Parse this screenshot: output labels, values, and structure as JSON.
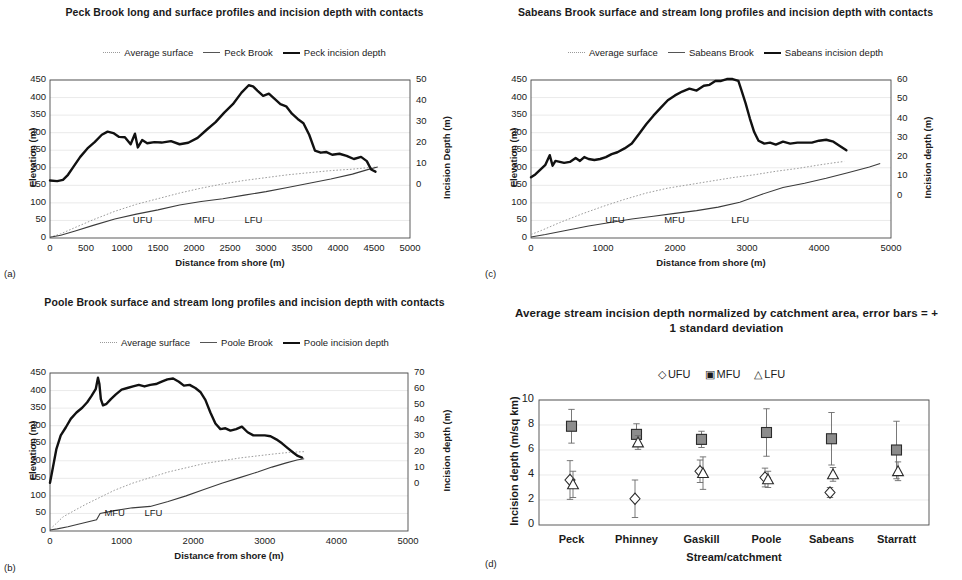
{
  "figure": {
    "panels": [
      {
        "tag": "(a)",
        "title": "Peck Brook long and surface profiles and incision depth with contacts",
        "legend": [
          {
            "label": "Average surface",
            "style": "dotted"
          },
          {
            "label": "Peck Brook",
            "style": "thin"
          },
          {
            "label": "Peck incision depth",
            "style": "thick"
          }
        ],
        "contacts": [
          {
            "label": "UFU",
            "x": 1150
          },
          {
            "label": "MFU",
            "x": 2000
          },
          {
            "label": "LFU",
            "x": 2700
          }
        ]
      },
      {
        "tag": "(b)",
        "title": "Poole Brook surface and stream long profiles and incision depth with contacts",
        "legend": [
          {
            "label": "Average surface",
            "style": "dotted"
          },
          {
            "label": "Poole Brook",
            "style": "thin"
          },
          {
            "label": "Poole incision depth",
            "style": "thick"
          }
        ],
        "contacts": [
          {
            "label": "MFU",
            "x": 760
          },
          {
            "label": "LFU",
            "x": 1320
          }
        ]
      },
      {
        "tag": "(c)",
        "title": "Sabeans Brook surface and stream long profiles and incision depth with contacts",
        "legend": [
          {
            "label": "Average surface",
            "style": "dotted"
          },
          {
            "label": "Sabeans Brook",
            "style": "thin"
          },
          {
            "label": "Sabeans incision depth",
            "style": "thick"
          }
        ],
        "contacts": [
          {
            "label": "UFU",
            "x": 1030
          },
          {
            "label": "MFU",
            "x": 1850
          },
          {
            "label": "LFU",
            "x": 2780
          }
        ]
      },
      {
        "tag": "(d)",
        "title": "Average stream incision depth normalized by catchment area, error bars = + 1 standard deviation",
        "legend": [
          {
            "label": "UFU",
            "glyph": "◇"
          },
          {
            "label": "MFU",
            "glyph": "▣"
          },
          {
            "label": "LFU",
            "glyph": "△"
          }
        ]
      }
    ]
  },
  "chart_data": [
    {
      "type": "line",
      "panel": "a",
      "title": "Peck Brook long and surface profiles and incision depth with contacts",
      "xlabel": "Distance from shore (m)",
      "ylabel": "Elevation (m)",
      "y2label": "Incision Depth (m)",
      "xlim": [
        0,
        5000
      ],
      "xticks": [
        0,
        500,
        1000,
        1500,
        2000,
        2500,
        3000,
        3500,
        4000,
        4500,
        5000
      ],
      "ylim": [
        0,
        450
      ],
      "yticks": [
        0,
        50,
        100,
        150,
        200,
        250,
        300,
        350,
        400,
        450
      ],
      "y2lim": [
        -25,
        50
      ],
      "y2ticks": [
        0,
        10,
        20,
        30,
        40,
        50
      ],
      "grid": true,
      "legend_position": "top",
      "series": [
        {
          "name": "Average surface",
          "style": "dotted",
          "axis": "left",
          "x": [
            0,
            150,
            350,
            600,
            900,
            1200,
            1500,
            1800,
            2100,
            2400,
            2700,
            3000,
            3300,
            3600,
            3900,
            4200,
            4400,
            4550
          ],
          "values": [
            2,
            12,
            30,
            52,
            76,
            96,
            112,
            128,
            142,
            154,
            164,
            172,
            180,
            186,
            192,
            196,
            200,
            202
          ]
        },
        {
          "name": "Peck Brook",
          "style": "thin",
          "axis": "left",
          "x": [
            0,
            150,
            350,
            600,
            900,
            1200,
            1500,
            1800,
            2100,
            2400,
            2700,
            3000,
            3300,
            3600,
            3900,
            4200,
            4400,
            4550
          ],
          "values": [
            2,
            8,
            20,
            36,
            54,
            68,
            80,
            94,
            104,
            112,
            122,
            132,
            144,
            156,
            168,
            182,
            194,
            202
          ]
        },
        {
          "name": "Peck incision depth",
          "style": "thick",
          "axis": "right",
          "x": [
            0,
            100,
            180,
            250,
            320,
            420,
            520,
            620,
            720,
            800,
            880,
            960,
            1040,
            1120,
            1180,
            1220,
            1280,
            1350,
            1450,
            1550,
            1680,
            1800,
            1920,
            2050,
            2180,
            2300,
            2420,
            2540,
            2660,
            2760,
            2820,
            2880,
            2960,
            3040,
            3120,
            3200,
            3280,
            3360,
            3440,
            3520,
            3600,
            3680,
            3760,
            3840,
            3920,
            4020,
            4120,
            4220,
            4320,
            4400,
            4460,
            4520
          ],
          "values": [
            2.3,
            2.0,
            2.6,
            5.0,
            8.5,
            13.5,
            17.5,
            20.5,
            24.0,
            25.5,
            24.8,
            23.0,
            22.8,
            19.5,
            24.5,
            18.0,
            21.5,
            20.0,
            20.5,
            20.3,
            21.0,
            19.5,
            20.2,
            22.5,
            26.5,
            30.0,
            34.5,
            38.5,
            44.0,
            47.5,
            47.0,
            45.0,
            42.5,
            43.5,
            41.0,
            38.5,
            37.5,
            34.0,
            31.5,
            29.5,
            24.0,
            16.5,
            15.5,
            15.8,
            14.5,
            15.0,
            14.0,
            12.5,
            13.5,
            11.5,
            7.5,
            6.5
          ]
        }
      ]
    },
    {
      "type": "line",
      "panel": "b",
      "title": "Poole Brook surface and stream long profiles and incision depth with contacts",
      "xlabel": "Distance from shore (m)",
      "ylabel": "Elevation (m)",
      "y2label": "Incision depth (m)",
      "xlim": [
        0,
        5000
      ],
      "xticks": [
        0,
        1000,
        2000,
        3000,
        4000,
        5000
      ],
      "ylim": [
        0,
        450
      ],
      "yticks": [
        0,
        50,
        100,
        150,
        200,
        250,
        300,
        350,
        400,
        450
      ],
      "y2lim": [
        -30,
        70
      ],
      "y2ticks": [
        0,
        10,
        20,
        30,
        40,
        50,
        60,
        70
      ],
      "grid": true,
      "legend_position": "top",
      "series": [
        {
          "name": "Average surface",
          "style": "dotted",
          "axis": "left",
          "x": [
            0,
            80,
            180,
            320,
            500,
            700,
            900,
            1150,
            1400,
            1650,
            1900,
            2150,
            2400,
            2650,
            2900,
            3150,
            3350,
            3550
          ],
          "values": [
            5,
            20,
            40,
            56,
            76,
            96,
            116,
            136,
            152,
            168,
            180,
            192,
            200,
            208,
            214,
            220,
            224,
            226
          ]
        },
        {
          "name": "Poole Brook",
          "style": "thin",
          "axis": "left",
          "x": [
            0,
            100,
            250,
            450,
            650,
            700,
            900,
            1150,
            1400,
            1650,
            1900,
            2150,
            2400,
            2650,
            2900,
            3100,
            3300,
            3450,
            3550
          ],
          "values": [
            3,
            6,
            12,
            22,
            32,
            50,
            58,
            66,
            70,
            84,
            100,
            118,
            136,
            152,
            168,
            182,
            194,
            202,
            206
          ]
        },
        {
          "name": "Poole incision depth",
          "style": "thick",
          "axis": "right",
          "x": [
            0,
            40,
            90,
            150,
            220,
            290,
            370,
            450,
            520,
            580,
            640,
            670,
            690,
            710,
            740,
            790,
            850,
            920,
            1000,
            1080,
            1160,
            1240,
            1320,
            1400,
            1480,
            1560,
            1640,
            1720,
            1800,
            1870,
            1950,
            2030,
            2100,
            2170,
            2240,
            2310,
            2380,
            2450,
            2520,
            2600,
            2680,
            2760,
            2840,
            2920,
            3000,
            3080,
            3160,
            3240,
            3320,
            3400,
            3460,
            3520
          ],
          "values": [
            0.5,
            10.0,
            22.0,
            30.5,
            35.5,
            41.0,
            45.0,
            48.0,
            51.5,
            55.5,
            60.0,
            67.0,
            63.0,
            53.5,
            49.5,
            50.5,
            53.5,
            56.5,
            59.5,
            60.5,
            61.5,
            62.5,
            61.5,
            62.5,
            63.0,
            64.5,
            66.0,
            66.5,
            64.5,
            62.0,
            62.5,
            60.5,
            58.0,
            53.0,
            45.0,
            38.0,
            34.5,
            35.0,
            33.5,
            34.5,
            36.0,
            32.5,
            30.5,
            30.5,
            30.5,
            30.0,
            28.0,
            25.5,
            22.5,
            19.5,
            17.5,
            16.5
          ]
        }
      ]
    },
    {
      "type": "line",
      "panel": "c",
      "title": "Sabeans Brook surface and stream long profiles and incision depth with contacts",
      "xlabel": "Distance from shore (m)",
      "ylabel": "Elevation (m)",
      "y2label": "Incision depth (m)",
      "xlim": [
        0,
        5000
      ],
      "xticks": [
        0,
        1000,
        2000,
        3000,
        4000,
        5000
      ],
      "ylim": [
        0,
        450
      ],
      "yticks": [
        0,
        50,
        100,
        150,
        200,
        250,
        300,
        350,
        400,
        450
      ],
      "y2lim": [
        -22,
        60
      ],
      "y2ticks": [
        0,
        10,
        20,
        30,
        40,
        50,
        60
      ],
      "grid": true,
      "legend_position": "top",
      "series": [
        {
          "name": "Average surface",
          "style": "dotted",
          "axis": "left",
          "x": [
            0,
            150,
            400,
            700,
            1000,
            1300,
            1600,
            1900,
            2200,
            2500,
            2800,
            3100,
            3400,
            3700,
            4000,
            4200,
            4350
          ],
          "values": [
            10,
            22,
            44,
            68,
            90,
            110,
            128,
            142,
            152,
            162,
            172,
            180,
            190,
            198,
            208,
            214,
            218
          ]
        },
        {
          "name": "Sabeans Brook",
          "style": "thin",
          "axis": "left",
          "x": [
            0,
            200,
            500,
            800,
            1100,
            1400,
            1700,
            2000,
            2300,
            2600,
            2900,
            3200,
            3500,
            3800,
            4100,
            4400,
            4700,
            4850
          ],
          "values": [
            3,
            10,
            22,
            34,
            44,
            54,
            62,
            70,
            78,
            88,
            102,
            124,
            144,
            156,
            170,
            186,
            202,
            212
          ]
        },
        {
          "name": "Sabeans incision depth",
          "style": "thick",
          "axis": "right",
          "x": [
            0,
            60,
            130,
            200,
            260,
            300,
            340,
            400,
            460,
            540,
            620,
            680,
            740,
            800,
            880,
            960,
            1040,
            1120,
            1200,
            1300,
            1400,
            1500,
            1600,
            1700,
            1800,
            1900,
            2000,
            2100,
            2200,
            2300,
            2400,
            2480,
            2560,
            2640,
            2720,
            2800,
            2880,
            2920,
            2980,
            3040,
            3100,
            3160,
            3240,
            3320,
            3400,
            3500,
            3600,
            3700,
            3800,
            3900,
            4000,
            4100,
            4200,
            4300,
            4380
          ],
          "values": [
            9.5,
            11.0,
            13.5,
            16.0,
            21.0,
            15.5,
            18.0,
            17.5,
            17.0,
            17.5,
            19.5,
            18.0,
            20.0,
            19.0,
            18.5,
            19.0,
            20.0,
            21.5,
            22.5,
            24.5,
            27.0,
            32.0,
            37.0,
            41.5,
            45.5,
            49.5,
            52.0,
            54.0,
            55.5,
            54.5,
            57.0,
            57.5,
            59.5,
            59.5,
            60.5,
            60.5,
            59.5,
            55.0,
            48.0,
            40.0,
            33.0,
            28.5,
            27.0,
            27.5,
            26.5,
            28.0,
            27.0,
            27.5,
            27.5,
            27.5,
            28.5,
            29.0,
            28.0,
            25.5,
            23.5
          ]
        }
      ]
    },
    {
      "type": "scatter",
      "panel": "d",
      "title": "Average stream incision depth normalized by catchment area, error bars = + 1 standard deviation",
      "xlabel": "Stream/catchment",
      "ylabel": "Incision depth (m/sq km)",
      "ylim": [
        0,
        10
      ],
      "yticks": [
        0,
        2,
        4,
        6,
        8,
        10
      ],
      "grid": true,
      "legend_position": "top",
      "categories": [
        "Peck",
        "Phinney",
        "Gaskill",
        "Poole",
        "Sabeans",
        "Starratt"
      ],
      "series": [
        {
          "name": "UFU",
          "glyph": "diamond",
          "values": [
            3.6,
            2.1,
            4.3,
            3.8,
            2.6,
            null
          ],
          "errors": [
            1.55,
            1.5,
            0.9,
            0.75,
            0.4,
            null
          ]
        },
        {
          "name": "MFU",
          "glyph": "square",
          "values": [
            7.9,
            7.25,
            6.85,
            7.4,
            6.9,
            6.0
          ],
          "errors": [
            1.35,
            0.85,
            0.65,
            1.9,
            2.1,
            2.3
          ]
        },
        {
          "name": "LFU",
          "glyph": "triangle",
          "values": [
            3.25,
            6.6,
            4.15,
            3.65,
            4.05,
            4.3
          ],
          "errors": [
            1.05,
            0.55,
            1.3,
            0.65,
            0.55,
            0.75
          ]
        }
      ]
    }
  ]
}
